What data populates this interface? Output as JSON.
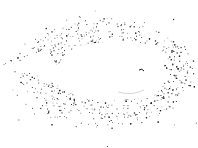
{
  "image": {
    "description": "White whale silhouette in negative space surrounded by stippled black spray dots",
    "subject": "whale",
    "colors": {
      "background": "#ffffff",
      "dots": "#1a1a1a",
      "whale": "#ffffff"
    }
  }
}
